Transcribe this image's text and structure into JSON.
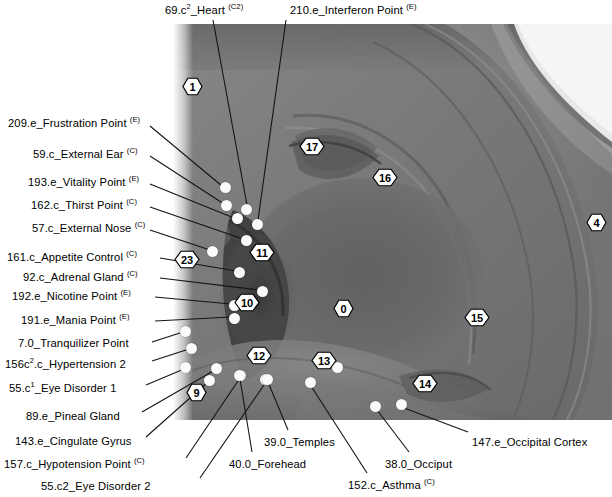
{
  "figure": {
    "image_kind": "grayscale-ear-photograph"
  },
  "labels": [
    {
      "id": "heart",
      "text_html": "69.c<sup>2</sup>_Heart <span class=\"sm\">(C2)</span>",
      "text": "69.c2_Heart (C2)",
      "x": 165,
      "y": 5,
      "anchor": "left"
    },
    {
      "id": "interferon",
      "text_html": "210.e_Interferon Point <span class=\"sm\">(E)</span>",
      "text": "210.e_Interferon Point (E)",
      "x": 290,
      "y": 5,
      "anchor": "left"
    },
    {
      "id": "frustration",
      "text_html": "209.e_Frustration Point <span class=\"sm\">(E)</span>",
      "text": "209.e_Frustration Point (E)",
      "x": 8,
      "y": 118,
      "anchor": "left"
    },
    {
      "id": "external-ear",
      "text_html": "59.c_External Ear <span class=\"sm\">(C)</span>",
      "text": "59.c_External Ear (C)",
      "x": 33,
      "y": 149,
      "anchor": "left"
    },
    {
      "id": "vitality",
      "text_html": "193.e_Vitality Point <span class=\"sm\">(E)</span>",
      "text": "193.e_Vitality Point (E)",
      "x": 28,
      "y": 177,
      "anchor": "left"
    },
    {
      "id": "thirst",
      "text_html": "162.c_Thirst Point <span class=\"sm\">(C)</span>",
      "text": "162.c_Thirst Point (C)",
      "x": 31,
      "y": 200,
      "anchor": "left"
    },
    {
      "id": "external-nose",
      "text_html": "57.c_External Nose <span class=\"sm\">(C)</span>",
      "text": "57.c_External Nose (C)",
      "x": 32,
      "y": 223,
      "anchor": "left"
    },
    {
      "id": "appetite-control",
      "text_html": "161.c_Appetite Control <span class=\"sm\">(C)</span>",
      "text": "161.c_Appetite Control (C)",
      "x": 7,
      "y": 252,
      "anchor": "left"
    },
    {
      "id": "adrenal-gland",
      "text_html": "92.c_Adrenal Gland <span class=\"sm\">(C)</span>",
      "text": "92.c_Adrenal Gland (C)",
      "x": 23,
      "y": 272,
      "anchor": "left"
    },
    {
      "id": "nicotine",
      "text_html": "192.e_Nicotine Point <span class=\"sm\">(E)</span>",
      "text": "192.e_Nicotine Point (E)",
      "x": 12,
      "y": 291,
      "anchor": "left"
    },
    {
      "id": "mania",
      "text_html": "191.e_Mania Point <span class=\"sm\">(E)</span>",
      "text": "191.e_Mania Point (E)",
      "x": 21,
      "y": 315,
      "anchor": "left"
    },
    {
      "id": "tranquilizer",
      "text_html": "7.0_Tranquilizer Point",
      "text": "7.0_Tranquilizer Point",
      "x": 18,
      "y": 338,
      "anchor": "left"
    },
    {
      "id": "hypertension-2",
      "text_html": "156c<sup>2</sup>.c_Hypertension 2",
      "text": "156c2.c_Hypertension 2",
      "x": 5,
      "y": 359,
      "anchor": "left"
    },
    {
      "id": "eye-disorder-1",
      "text_html": "55.c<sup>1</sup>_Eye Disorder 1",
      "text": "55.c1_Eye Disorder 1",
      "x": 9,
      "y": 383,
      "anchor": "left"
    },
    {
      "id": "pineal-gland",
      "text_html": "89.e_Pineal Gland",
      "text": "89.e_Pineal Gland",
      "x": 26,
      "y": 411,
      "anchor": "left"
    },
    {
      "id": "cingulate-gyrus",
      "text_html": "143.e_Cingulate Gyrus",
      "text": "143.e_Cingulate Gyrus",
      "x": 15,
      "y": 436,
      "anchor": "left"
    },
    {
      "id": "hypotension",
      "text_html": "157.c_Hypotension Point <span class=\"sm\">(C)</span>",
      "text": "157.c_Hypotension Point (C)",
      "x": 4,
      "y": 459,
      "anchor": "left"
    },
    {
      "id": "eye-disorder-2",
      "text_html": "55.c2_Eye Disorder 2",
      "text": "55.c2_Eye Disorder 2",
      "x": 41,
      "y": 481,
      "anchor": "left"
    },
    {
      "id": "forehead",
      "text_html": "40.0_Forehead",
      "text": "40.0_Forehead",
      "x": 229,
      "y": 459,
      "anchor": "left"
    },
    {
      "id": "temples",
      "text_html": "39.0_Temples",
      "text": "39.0_Temples",
      "x": 264,
      "y": 437,
      "anchor": "left"
    },
    {
      "id": "asthma",
      "text_html": "152.c_Asthma <span class=\"sm\">(C)</span>",
      "text": "152.c_Asthma (C)",
      "x": 348,
      "y": 480,
      "anchor": "left"
    },
    {
      "id": "occiput",
      "text_html": "38.0_Occiput",
      "text": "38.0_Occiput",
      "x": 385,
      "y": 459,
      "anchor": "left"
    },
    {
      "id": "occipital-cortex",
      "text_html": "147.e_Occipital Cortex",
      "text": "147.e_Occipital Cortex",
      "x": 472,
      "y": 437,
      "anchor": "left"
    }
  ],
  "markers": [
    {
      "id": "zone-1",
      "label": "1",
      "x": 192,
      "y": 86
    },
    {
      "id": "zone-17",
      "label": "17",
      "x": 312,
      "y": 146
    },
    {
      "id": "zone-16",
      "label": "16",
      "x": 385,
      "y": 177
    },
    {
      "id": "zone-4",
      "label": "4",
      "x": 596,
      "y": 222
    },
    {
      "id": "zone-11",
      "label": "11",
      "x": 262,
      "y": 252
    },
    {
      "id": "zone-23",
      "label": "23",
      "x": 187,
      "y": 259
    },
    {
      "id": "zone-10",
      "label": "10",
      "x": 247,
      "y": 302
    },
    {
      "id": "zone-0",
      "label": "0",
      "x": 343,
      "y": 308
    },
    {
      "id": "zone-15",
      "label": "15",
      "x": 477,
      "y": 317
    },
    {
      "id": "zone-12",
      "label": "12",
      "x": 259,
      "y": 355
    },
    {
      "id": "zone-13",
      "label": "13",
      "x": 324,
      "y": 360
    },
    {
      "id": "zone-14",
      "label": "14",
      "x": 425,
      "y": 383
    },
    {
      "id": "zone-9",
      "label": "9",
      "x": 196,
      "y": 392
    }
  ],
  "points": [
    {
      "id": "pt-heart",
      "x": 246,
      "y": 209
    },
    {
      "id": "pt-interferon",
      "x": 257,
      "y": 224
    },
    {
      "id": "pt-frustration",
      "x": 225,
      "y": 187
    },
    {
      "id": "pt-external-ear",
      "x": 226,
      "y": 205
    },
    {
      "id": "pt-vitality",
      "x": 237,
      "y": 218
    },
    {
      "id": "pt-thirst",
      "x": 246,
      "y": 240
    },
    {
      "id": "pt-external-nose",
      "x": 212,
      "y": 251
    },
    {
      "id": "pt-appetite",
      "x": 239,
      "y": 272
    },
    {
      "id": "pt-adrenal",
      "x": 262,
      "y": 291
    },
    {
      "id": "pt-nicotine",
      "x": 234,
      "y": 305
    },
    {
      "id": "pt-mania",
      "x": 234,
      "y": 318
    },
    {
      "id": "pt-tranquilizer",
      "x": 185,
      "y": 331
    },
    {
      "id": "pt-hypertension2",
      "x": 191,
      "y": 348
    },
    {
      "id": "pt-eye1",
      "x": 185,
      "y": 367
    },
    {
      "id": "pt-pineal",
      "x": 216,
      "y": 368
    },
    {
      "id": "pt-cingulate",
      "x": 209,
      "y": 380
    },
    {
      "id": "pt-hypotension",
      "x": 240,
      "y": 375
    },
    {
      "id": "pt-eye2",
      "x": 265,
      "y": 379
    },
    {
      "id": "pt-forehead",
      "x": 239,
      "y": 375
    },
    {
      "id": "pt-temples",
      "x": 267,
      "y": 379
    },
    {
      "id": "pt-asthma",
      "x": 310,
      "y": 382
    },
    {
      "id": "pt-occiput",
      "x": 375,
      "y": 406
    },
    {
      "id": "pt-occipital-cortex",
      "x": 401,
      "y": 404
    },
    {
      "id": "pt-zone13a",
      "x": 337,
      "y": 367
    }
  ],
  "leaders": [
    {
      "id": "ld-heart",
      "x1": 213,
      "y1": 20,
      "x2": 247,
      "y2": 205
    },
    {
      "id": "ld-interferon",
      "x1": 286,
      "y1": 20,
      "x2": 258,
      "y2": 220
    },
    {
      "id": "ld-frustration",
      "x1": 150,
      "y1": 126,
      "x2": 222,
      "y2": 186
    },
    {
      "id": "ld-external-ear",
      "x1": 150,
      "y1": 156,
      "x2": 224,
      "y2": 204
    },
    {
      "id": "ld-vitality",
      "x1": 150,
      "y1": 184,
      "x2": 234,
      "y2": 218
    },
    {
      "id": "ld-thirst",
      "x1": 150,
      "y1": 207,
      "x2": 243,
      "y2": 239
    },
    {
      "id": "ld-external-nose",
      "x1": 150,
      "y1": 230,
      "x2": 210,
      "y2": 250
    },
    {
      "id": "ld-appetite",
      "x1": 160,
      "y1": 258,
      "x2": 236,
      "y2": 271
    },
    {
      "id": "ld-adrenal",
      "x1": 160,
      "y1": 278,
      "x2": 259,
      "y2": 290
    },
    {
      "id": "ld-nicotine",
      "x1": 155,
      "y1": 297,
      "x2": 231,
      "y2": 304
    },
    {
      "id": "ld-mania",
      "x1": 155,
      "y1": 321,
      "x2": 231,
      "y2": 317
    },
    {
      "id": "ld-tranquilizer",
      "x1": 152,
      "y1": 342,
      "x2": 183,
      "y2": 332
    },
    {
      "id": "ld-hypertension2",
      "x1": 152,
      "y1": 361,
      "x2": 189,
      "y2": 349
    },
    {
      "id": "ld-eye1",
      "x1": 146,
      "y1": 385,
      "x2": 184,
      "y2": 369
    },
    {
      "id": "ld-pineal",
      "x1": 142,
      "y1": 412,
      "x2": 215,
      "y2": 370
    },
    {
      "id": "ld-cingulate",
      "x1": 146,
      "y1": 437,
      "x2": 208,
      "y2": 382
    },
    {
      "id": "ld-hypotension",
      "x1": 186,
      "y1": 458,
      "x2": 240,
      "y2": 378
    },
    {
      "id": "ld-eye2",
      "x1": 200,
      "y1": 478,
      "x2": 266,
      "y2": 382
    },
    {
      "id": "ld-forehead",
      "x1": 252,
      "y1": 452,
      "x2": 240,
      "y2": 379
    },
    {
      "id": "ld-temples",
      "x1": 288,
      "y1": 430,
      "x2": 268,
      "y2": 382
    },
    {
      "id": "ld-asthma",
      "x1": 367,
      "y1": 473,
      "x2": 311,
      "y2": 386
    },
    {
      "id": "ld-occiput",
      "x1": 409,
      "y1": 452,
      "x2": 377,
      "y2": 410
    },
    {
      "id": "ld-occipital-cortex",
      "x1": 468,
      "y1": 432,
      "x2": 404,
      "y2": 408
    }
  ],
  "colors": {
    "background": "#ffffff",
    "text": "#000000",
    "point_fill": "#fbfbfb",
    "leader_line": "#141414",
    "marker_fill": "#ffffff",
    "marker_stroke": "#000000"
  }
}
